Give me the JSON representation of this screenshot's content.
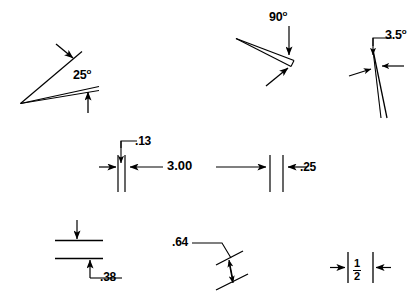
{
  "sheet": {
    "title": "Angular and linear dimension callout examples",
    "background_color": "#ffffff",
    "line_color": "#000000",
    "width": 420,
    "height": 307
  },
  "figures": [
    {
      "id": "angle-25",
      "name": "angle-25-degrees",
      "label": "25",
      "unit_symbol": "o",
      "kind": "angle",
      "value": 25,
      "description": "Wide wedge opening to the right, arrows pointing into the included angle"
    },
    {
      "id": "angle-90",
      "name": "angle-90-degrees",
      "label": "90",
      "unit_symbol": "o",
      "kind": "angle",
      "value": 90,
      "description": "Narrow wedge opening to the left with vertical leader arrow and lower diagonal arrow"
    },
    {
      "id": "angle-3-5",
      "name": "angle-3-5-degrees",
      "label": "3.5",
      "unit_symbol": "o",
      "kind": "angle",
      "value": 3.5,
      "description": "Very narrow near-vertical wedge with opposing horizontal arrows and top leader"
    },
    {
      "id": "dim-13",
      "name": "dimension-point-13",
      "label": ".13",
      "kind": "linear",
      "value": 0.13,
      "description": "Narrow width between two close extension lines, leader from upper right"
    },
    {
      "id": "dim-300",
      "name": "dimension-3-00",
      "label": "3.00",
      "kind": "linear",
      "value": 3.0,
      "description": "Long horizontal dimension with arrowheads at both ends"
    },
    {
      "id": "dim-25",
      "name": "dimension-point-25",
      "label": ".25",
      "kind": "linear",
      "value": 0.25,
      "description": "Short gap dimension with arrow pointing left into the gap"
    },
    {
      "id": "dim-38",
      "name": "dimension-point-38",
      "label": ".38",
      "kind": "linear-vertical",
      "value": 0.38,
      "description": "Vertical distance between two horizontal lines with leader to the lower right"
    },
    {
      "id": "dim-64",
      "name": "dimension-point-64",
      "label": ".64",
      "kind": "linear-oblique",
      "value": 0.64,
      "description": "Oblique dimension between two slanted lines with leader going left"
    },
    {
      "id": "dim-half",
      "name": "dimension-one-half-fraction",
      "label_numerator": "1",
      "label_denominator": "2",
      "kind": "fraction",
      "value": 0.5,
      "description": "Fraction one-half between two vertical extension lines with outward arrows"
    }
  ]
}
